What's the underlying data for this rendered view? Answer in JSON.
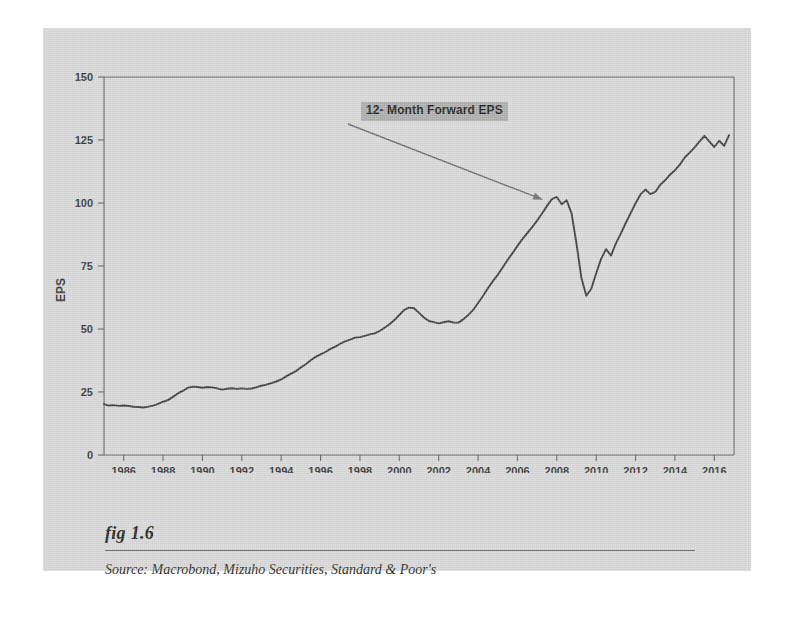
{
  "figure": {
    "number_label": "fig 1.6",
    "source_label": "Source:  Macrobond, Mizuho Securities, Standard & Poor's",
    "background_color": "#d6d6d6",
    "line_color": "#3a3a3a",
    "annotation_bg_color": "#aaaaaa"
  },
  "annotation": {
    "text": "12- Month Forward EPS"
  },
  "chart_data": {
    "type": "line",
    "title": "",
    "subtitle": "",
    "xlabel": "",
    "ylabel": "EPS",
    "xlim": [
      1985.0,
      2017.0
    ],
    "ylim": [
      0,
      150
    ],
    "grid": false,
    "legend": null,
    "xticks": [
      1986,
      1988,
      1990,
      1992,
      1994,
      1996,
      1998,
      2000,
      2002,
      2004,
      2006,
      2008,
      2010,
      2012,
      2014,
      2016
    ],
    "xtick_labels": [
      "1986",
      "1988",
      "1990",
      "1992",
      "1994",
      "1996",
      "1998",
      "2000",
      "2002",
      "2004",
      "2006",
      "2008",
      "2010",
      "2012",
      "2014",
      "2016"
    ],
    "yticks": [
      0,
      25,
      50,
      75,
      100,
      125,
      150
    ],
    "ytick_labels": [
      "0",
      "25",
      "50",
      "75",
      "100",
      "125",
      "150"
    ],
    "annotations": [
      {
        "text": "12- Month Forward EPS",
        "points_to_x": 2007.4,
        "points_to_y": 101.0
      }
    ],
    "series": [
      {
        "name": "12- Month Forward EPS",
        "color": "#3a3a3a",
        "x": [
          1985.0,
          1985.25,
          1985.5,
          1985.75,
          1986.0,
          1986.25,
          1986.5,
          1986.75,
          1987.0,
          1987.25,
          1987.5,
          1987.75,
          1988.0,
          1988.25,
          1988.5,
          1988.75,
          1989.0,
          1989.25,
          1989.5,
          1989.75,
          1990.0,
          1990.25,
          1990.5,
          1990.75,
          1991.0,
          1991.25,
          1991.5,
          1991.75,
          1992.0,
          1992.25,
          1992.5,
          1992.75,
          1993.0,
          1993.25,
          1993.5,
          1993.75,
          1994.0,
          1994.25,
          1994.5,
          1994.75,
          1995.0,
          1995.25,
          1995.5,
          1995.75,
          1996.0,
          1996.25,
          1996.5,
          1996.75,
          1997.0,
          1997.25,
          1997.5,
          1997.75,
          1998.0,
          1998.25,
          1998.5,
          1998.75,
          1999.0,
          1999.25,
          1999.5,
          1999.75,
          2000.0,
          2000.25,
          2000.5,
          2000.75,
          2001.0,
          2001.25,
          2001.5,
          2001.75,
          2002.0,
          2002.25,
          2002.5,
          2002.75,
          2003.0,
          2003.25,
          2003.5,
          2003.75,
          2004.0,
          2004.25,
          2004.5,
          2004.75,
          2005.0,
          2005.25,
          2005.5,
          2005.75,
          2006.0,
          2006.25,
          2006.5,
          2006.75,
          2007.0,
          2007.25,
          2007.5,
          2007.75,
          2008.0,
          2008.25,
          2008.5,
          2008.75,
          2009.0,
          2009.25,
          2009.5,
          2009.75,
          2010.0,
          2010.25,
          2010.5,
          2010.75,
          2011.0,
          2011.25,
          2011.5,
          2011.75,
          2012.0,
          2012.25,
          2012.5,
          2012.75,
          2013.0,
          2013.25,
          2013.5,
          2013.75,
          2014.0,
          2014.25,
          2014.5,
          2014.75,
          2015.0,
          2015.25,
          2015.5,
          2015.75,
          2016.0,
          2016.25,
          2016.5,
          2016.75
        ],
        "y": [
          20.0,
          19.8,
          19.6,
          19.5,
          19.6,
          19.4,
          19.2,
          18.9,
          18.8,
          19.2,
          19.8,
          20.4,
          21.0,
          22.0,
          23.2,
          24.4,
          25.6,
          26.6,
          27.2,
          26.9,
          26.8,
          27.0,
          26.9,
          26.4,
          25.8,
          26.2,
          26.5,
          26.0,
          26.3,
          26.2,
          26.6,
          27.0,
          27.4,
          27.9,
          28.4,
          29.2,
          30.2,
          31.4,
          32.3,
          33.4,
          34.8,
          36.2,
          37.6,
          38.8,
          40.0,
          41.0,
          42.0,
          43.0,
          44.0,
          44.9,
          45.7,
          46.4,
          46.9,
          47.3,
          47.8,
          48.4,
          49.2,
          50.4,
          51.8,
          53.4,
          55.4,
          57.4,
          58.6,
          58.0,
          56.2,
          54.4,
          53.2,
          52.6,
          52.2,
          52.6,
          53.0,
          52.6,
          52.4,
          53.6,
          55.4,
          57.6,
          60.2,
          63.2,
          66.0,
          68.8,
          71.6,
          74.4,
          77.2,
          80.0,
          82.8,
          85.6,
          88.0,
          90.4,
          93.0,
          96.0,
          99.0,
          101.4,
          102.4,
          99.6,
          101.2,
          96.0,
          84.0,
          70.0,
          63.0,
          66.0,
          72.0,
          78.0,
          81.5,
          79.0,
          84.0,
          88.0,
          92.0,
          96.0,
          100.0,
          103.6,
          105.2,
          103.6,
          104.2,
          107.0,
          109.0,
          111.2,
          113.0,
          115.4,
          118.0,
          120.2,
          122.0,
          124.6,
          126.8,
          124.2,
          122.0,
          124.8,
          122.6,
          126.8
        ]
      }
    ]
  }
}
